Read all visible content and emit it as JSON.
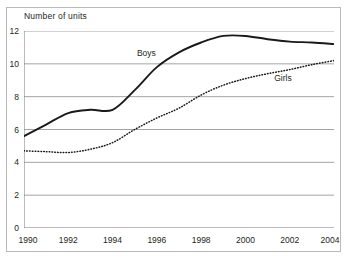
{
  "chart_data": {
    "type": "line",
    "title": "",
    "ylabel": "Number of units",
    "xlabel": "",
    "xlim": [
      1990,
      2004
    ],
    "ylim": [
      0,
      12
    ],
    "grid": "horizontal",
    "legend": "inline-labels",
    "x_ticks": [
      "1990",
      "1992",
      "1994",
      "1996",
      "1998",
      "2000",
      "2002",
      "2004"
    ],
    "x_tick_values": [
      1990,
      1992,
      1994,
      1996,
      1998,
      2000,
      2002,
      2004
    ],
    "y_ticks": [
      "0",
      "2",
      "4",
      "6",
      "8",
      "10",
      "12"
    ],
    "y_tick_values": [
      0,
      2,
      4,
      6,
      8,
      10,
      12
    ],
    "x": [
      1990,
      1991,
      1992,
      1993,
      1994,
      1995,
      1996,
      1997,
      1998,
      1999,
      2000,
      2001,
      2002,
      2003,
      2004
    ],
    "series": [
      {
        "name": "Boys",
        "style": "solid",
        "color": "#1a1a1a",
        "values": [
          5.6,
          6.3,
          7.0,
          7.2,
          7.2,
          8.4,
          9.8,
          10.7,
          11.3,
          11.7,
          11.7,
          11.5,
          11.35,
          11.3,
          11.2
        ],
        "label_x": 1995.1,
        "label_y": 10.6
      },
      {
        "name": "Girls",
        "style": "dotted",
        "color": "#1a1a1a",
        "values": [
          4.7,
          4.65,
          4.6,
          4.8,
          5.2,
          6.0,
          6.7,
          7.3,
          8.1,
          8.7,
          9.1,
          9.4,
          9.65,
          9.95,
          10.2
        ],
        "label_x": 2001.3,
        "label_y": 9.05
      }
    ]
  },
  "colors": {
    "axis": "#7a7a7a",
    "grid": "#9a9a9a",
    "frame": "#b9b9b9",
    "text": "#231f20",
    "line": "#1a1a1a",
    "background": "#ffffff"
  }
}
